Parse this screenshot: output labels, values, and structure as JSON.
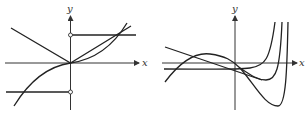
{
  "graphs": [
    {
      "id": "left",
      "x_label": "x",
      "y_label": "y",
      "description": "Step function with open circles on y-axis, absolute-value-like line, and cubic curve through origin"
    },
    {
      "id": "right",
      "x_label": "x",
      "y_label": "y",
      "description": "Family of curves: decreasing line, hump curve, and three curves rising steeply to the right"
    }
  ],
  "colors": {
    "stroke": "#222222",
    "background": "#ffffff"
  }
}
